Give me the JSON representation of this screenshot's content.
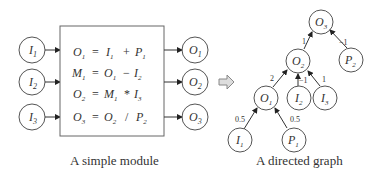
{
  "left": {
    "caption": "A simple module",
    "inputs": [
      {
        "base": "I",
        "sub": "1"
      },
      {
        "base": "I",
        "sub": "2"
      },
      {
        "base": "I",
        "sub": "3"
      }
    ],
    "outputs": [
      {
        "base": "O",
        "sub": "1"
      },
      {
        "base": "O",
        "sub": "2"
      },
      {
        "base": "O",
        "sub": "3"
      }
    ],
    "equations": [
      {
        "lhs": "O",
        "lhs_sub": "1",
        "eq": "=",
        "a": "I",
        "a_sub": "1",
        "op": "+",
        "b": "P",
        "b_sub": "1"
      },
      {
        "lhs": "M",
        "lhs_sub": "1",
        "eq": "=",
        "a": "O",
        "a_sub": "1",
        "op": "−",
        "b": "I",
        "b_sub": "2"
      },
      {
        "lhs": "O",
        "lhs_sub": "2",
        "eq": "=",
        "a": "M",
        "a_sub": "1",
        "op": "*",
        "b": "I",
        "b_sub": "3"
      },
      {
        "lhs": "O",
        "lhs_sub": "3",
        "eq": "=",
        "a": "O",
        "a_sub": "2",
        "op": "/",
        "b": "P",
        "b_sub": "2"
      }
    ]
  },
  "right": {
    "caption": "A directed graph",
    "nodes": {
      "O3": {
        "base": "O",
        "sub": "3"
      },
      "P2": {
        "base": "P",
        "sub": "2"
      },
      "O2": {
        "base": "O",
        "sub": "2"
      },
      "O1": {
        "base": "O",
        "sub": "1"
      },
      "I2": {
        "base": "I",
        "sub": "2"
      },
      "I3": {
        "base": "I",
        "sub": "3"
      },
      "I1": {
        "base": "I",
        "sub": "1"
      },
      "P1": {
        "base": "P",
        "sub": "1"
      }
    },
    "edges": {
      "O2_O3": "1",
      "P2_O3": "−1",
      "O1_O2": "2",
      "I2_O2": "−1",
      "I3_O2": "1",
      "I1_O1": "0.5",
      "P1_O1": "0.5"
    }
  },
  "arrow_icon": "block-arrow-right"
}
